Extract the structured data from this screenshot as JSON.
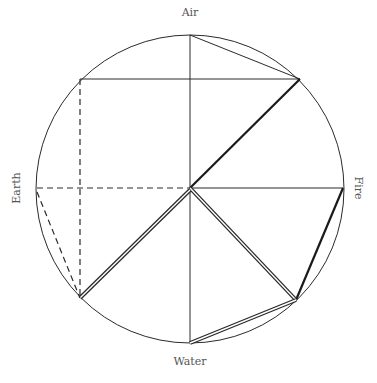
{
  "diagram": {
    "labels": {
      "top": "Air",
      "right": "Fire",
      "bottom": "Water",
      "left": "Earth"
    },
    "colors": {
      "line": "#2a2a2a",
      "label": "#555555",
      "background": "#ffffff"
    },
    "circle": {
      "cx": 190,
      "cy": 189,
      "r": 154
    }
  }
}
